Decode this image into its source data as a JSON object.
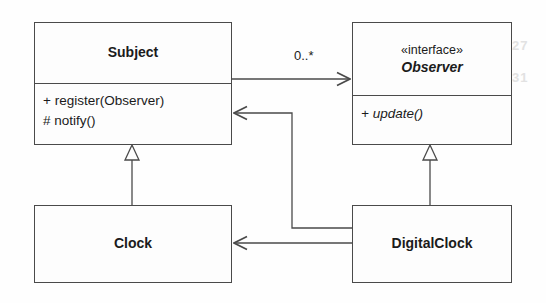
{
  "diagram": {
    "kind": "uml-class-diagram",
    "pattern": "Observer",
    "background_color": "#fefefe",
    "line_color": "#4a4a4a",
    "text_color": "#1b1b1b"
  },
  "classes": {
    "subject": {
      "name": "Subject",
      "members": [
        "+ register(Observer)",
        "# notify()"
      ]
    },
    "observer": {
      "stereotype": "«interface»",
      "name": "Observer",
      "members": [
        "+ update()"
      ]
    },
    "clock": {
      "name": "Clock"
    },
    "digital_clock": {
      "name": "DigitalClock"
    }
  },
  "relationships": {
    "subject_observes": {
      "from": "Subject",
      "to": "Observer",
      "type": "association",
      "multiplicity_label": "0..*"
    },
    "clock_extends_subject": {
      "from": "Clock",
      "to": "Subject",
      "type": "generalization"
    },
    "digitalclock_implements_observer": {
      "from": "DigitalClock",
      "to": "Observer",
      "type": "generalization"
    },
    "digitalclock_uses_subject": {
      "from": "DigitalClock",
      "to": "Subject",
      "type": "association"
    },
    "digitalclock_uses_clock": {
      "from": "DigitalClock",
      "to": "Clock",
      "type": "association"
    }
  },
  "scan_artifacts": [
    {
      "text": "27",
      "x": 512,
      "y": 38
    },
    {
      "text": "31",
      "x": 512,
      "y": 70
    }
  ]
}
